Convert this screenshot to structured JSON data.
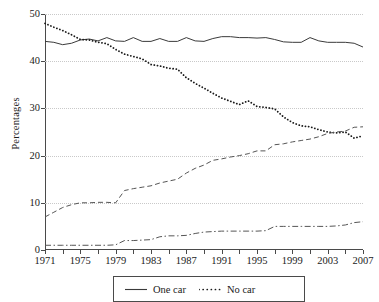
{
  "chart_data": {
    "type": "line",
    "title": "",
    "xlabel": "",
    "ylabel": "Percentages",
    "xlim": [
      1971,
      2007
    ],
    "ylim": [
      0,
      50
    ],
    "grid": true,
    "legend_position": "bottom",
    "yticks": [
      0,
      10,
      20,
      30,
      40,
      50
    ],
    "xticks": [
      1971,
      1975,
      1979,
      1983,
      1987,
      1991,
      1995,
      1999,
      2003,
      2007
    ],
    "xticks_minor": [
      1973,
      1977,
      1981,
      1985,
      1989,
      1993,
      1997,
      2001,
      2005
    ],
    "x": [
      1971,
      1972,
      1973,
      1974,
      1975,
      1976,
      1977,
      1978,
      1979,
      1980,
      1981,
      1982,
      1983,
      1984,
      1985,
      1986,
      1987,
      1988,
      1989,
      1990,
      1991,
      1992,
      1993,
      1994,
      1995,
      1996,
      1997,
      1998,
      1999,
      2000,
      2001,
      2002,
      2003,
      2004,
      2005,
      2006,
      2007
    ],
    "series": [
      {
        "name": "One car",
        "style": "solid",
        "color": "#3a3a3a",
        "values": [
          44.2,
          44.0,
          43.5,
          43.8,
          44.5,
          44.7,
          44.3,
          45.0,
          44.3,
          44.2,
          45.0,
          44.2,
          44.2,
          44.8,
          44.2,
          44.2,
          45.0,
          44.3,
          44.2,
          44.8,
          45.2,
          45.2,
          45.0,
          45.0,
          44.9,
          45.0,
          44.6,
          44.1,
          44.0,
          44.0,
          45.0,
          44.3,
          44.0,
          44.0,
          44.0,
          43.8,
          43.0
        ]
      },
      {
        "name": "No car",
        "style": "dotted",
        "color": "#1a1a1a",
        "values": [
          48.0,
          47.2,
          46.5,
          45.6,
          44.6,
          44.5,
          44.0,
          43.7,
          42.5,
          41.5,
          41.0,
          40.5,
          39.3,
          39.0,
          38.5,
          38.3,
          36.5,
          35.3,
          34.3,
          33.2,
          32.2,
          31.5,
          30.8,
          31.6,
          30.4,
          30.2,
          29.9,
          28.2,
          27.0,
          26.3,
          26.1,
          25.5,
          25.0,
          24.8,
          25.0,
          23.7,
          24.2
        ]
      },
      {
        "name": "Two cars",
        "style": "dashed",
        "color": "#555555",
        "values": [
          7.0,
          8.0,
          9.0,
          9.6,
          10.0,
          10.0,
          10.1,
          10.1,
          10.0,
          12.6,
          13.0,
          13.3,
          13.6,
          14.2,
          14.6,
          15.0,
          16.3,
          17.3,
          18.0,
          19.0,
          19.3,
          19.7,
          20.0,
          20.4,
          21.0,
          21.0,
          22.3,
          22.5,
          22.9,
          23.2,
          23.5,
          24.0,
          24.7,
          25.0,
          25.2,
          26.0,
          26.1
        ]
      },
      {
        "name": "Three or more cars",
        "style": "dashdot",
        "color": "#555555",
        "values": [
          1.0,
          1.0,
          1.0,
          1.0,
          1.0,
          1.0,
          1.0,
          1.0,
          1.1,
          2.0,
          2.0,
          2.1,
          2.2,
          2.8,
          3.0,
          3.0,
          3.1,
          3.5,
          3.8,
          3.9,
          4.0,
          4.0,
          4.0,
          4.0,
          4.0,
          4.1,
          5.0,
          5.0,
          5.0,
          5.0,
          5.0,
          5.0,
          5.0,
          5.1,
          5.3,
          5.8,
          6.0
        ]
      }
    ],
    "legend_entries": [
      {
        "label": "One car",
        "style": "solid"
      },
      {
        "label": "No car",
        "style": "dotted"
      }
    ]
  }
}
